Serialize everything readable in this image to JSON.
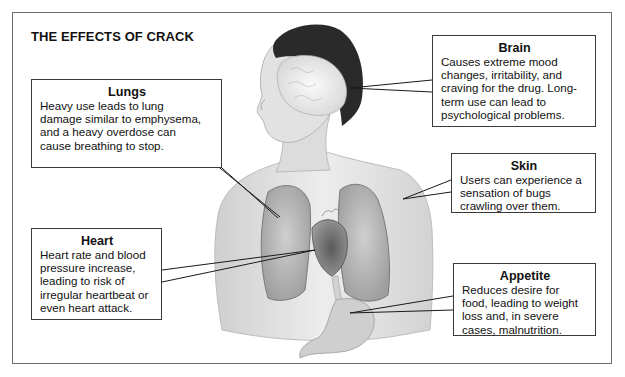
{
  "title": "THE EFFECTS OF CRACK",
  "figure": {
    "organs_shown": [
      "brain",
      "lungs",
      "heart",
      "stomach",
      "skin"
    ]
  },
  "callouts": {
    "lungs": {
      "heading": "Lungs",
      "lines": [
        "Heavy use leads to lung",
        "damage similar to emphysema,",
        "and a heavy overdose can",
        "cause breathing to stop."
      ]
    },
    "brain": {
      "heading": "Brain",
      "lines": [
        "Causes extreme mood",
        "changes, irritability, and",
        "craving for the drug. Long-",
        "term use can lead to",
        "psychological problems."
      ]
    },
    "skin": {
      "heading": "Skin",
      "lines": [
        "Users can experience a",
        "sensation of bugs",
        "crawling over them."
      ]
    },
    "heart": {
      "heading": "Heart",
      "lines": [
        "Heart rate and blood",
        "pressure increase,",
        "leading to risk of",
        "irregular heartbeat or",
        "even heart attack."
      ]
    },
    "appetite": {
      "heading": "Appetite",
      "lines": [
        "Reduces desire for",
        "food, leading to weight",
        "loss and, in severe",
        "cases, malnutrition."
      ]
    }
  },
  "colors": {
    "frame": "#6e6e6e",
    "callout_border": "#3a3a3a",
    "hair": "#2a2a2a",
    "skin": "#e4e4e4",
    "organ": "#b9b9b9",
    "heart": "#6a6a6a"
  }
}
